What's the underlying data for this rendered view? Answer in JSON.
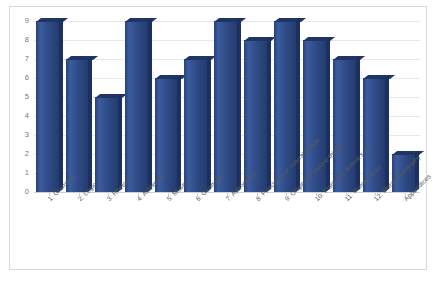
{
  "chart_data": {
    "type": "bar",
    "title": "",
    "xlabel": "",
    "ylabel": "",
    "categories": [
      "1: Grammar",
      "2: Logic",
      "3: Rhetoric",
      "4: Arithmetic",
      "5: Music",
      "6: Geometry",
      "7: Astronomy",
      "8: Principles of natural things",
      "9: Origins of natural things",
      "10: Plant and animal soul",
      "11: Human Soul",
      "12: Moral Philosophy",
      "Appendices"
    ],
    "values": [
      9,
      7,
      5,
      9,
      6,
      7,
      9,
      8,
      9,
      8,
      7,
      6,
      2
    ],
    "ylim": [
      0,
      9
    ],
    "y_ticks": [
      "0",
      "1",
      "2",
      "3",
      "4",
      "5",
      "6",
      "7",
      "8",
      "9"
    ],
    "grid": true,
    "legend": false,
    "series_color": "#2f4b86",
    "plot_background": "#ffffff",
    "gridline_color": "#e8e8e8",
    "border_color": "#d9d9d9"
  }
}
